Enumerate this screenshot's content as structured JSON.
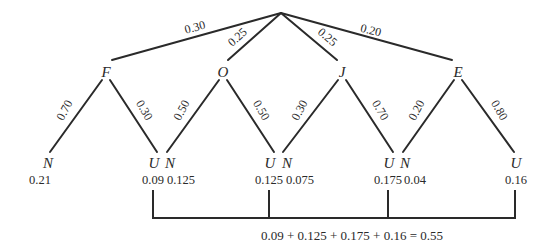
{
  "diagram": {
    "type": "probability-tree",
    "root": {
      "label": ""
    },
    "level1": [
      {
        "label": "F",
        "branch_prob": "0.30"
      },
      {
        "label": "O",
        "branch_prob": "0.25"
      },
      {
        "label": "J",
        "branch_prob": "0.25"
      },
      {
        "label": "E",
        "branch_prob": "0.20"
      }
    ],
    "level2": [
      {
        "parent": "F",
        "label": "N",
        "branch_prob": "0.70",
        "joint_prob": "0.21"
      },
      {
        "parent": "F",
        "label": "U",
        "branch_prob": "0.30",
        "joint_prob": "0.09"
      },
      {
        "parent": "O",
        "label": "N",
        "branch_prob": "0.50",
        "joint_prob": "0.125"
      },
      {
        "parent": "O",
        "label": "U",
        "branch_prob": "0.50",
        "joint_prob": "0.125"
      },
      {
        "parent": "J",
        "label": "N",
        "branch_prob": "0.30",
        "joint_prob": "0.075"
      },
      {
        "parent": "J",
        "label": "U",
        "branch_prob": "0.70",
        "joint_prob": "0.175"
      },
      {
        "parent": "E",
        "label": "N",
        "branch_prob": "0.20",
        "joint_prob": "0.04"
      },
      {
        "parent": "E",
        "label": "U",
        "branch_prob": "0.80",
        "joint_prob": "0.16"
      }
    ],
    "sum_equation": "0.09 + 0.125 + 0.175 + 0.16 = 0.55",
    "colors": {
      "line": "#2a2a2a",
      "background": "#ffffff"
    }
  }
}
